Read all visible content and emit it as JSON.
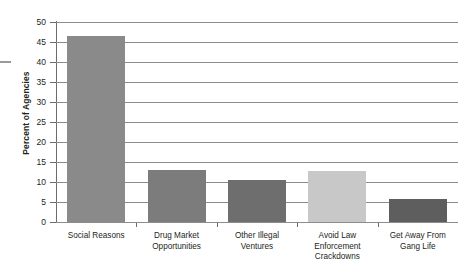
{
  "chart_data": {
    "type": "bar",
    "title": "",
    "xlabel": "",
    "ylabel": "Percent of Agencies",
    "ylim": [
      0,
      50
    ],
    "ytick_step": 5,
    "grid": true,
    "legend": false,
    "categories": [
      "Social Reasons",
      "Drug Market Opportunities",
      "Other Illegal Ventures",
      "Avoid Law Enforcement Crackdowns",
      "Get Away From Gang Life"
    ],
    "category_lines": [
      [
        "Social Reasons"
      ],
      [
        "Drug Market",
        "Opportunities"
      ],
      [
        "Other Illegal",
        "Ventures"
      ],
      [
        "Avoid Law",
        "Enforcement",
        "Crackdowns"
      ],
      [
        "Get Away From",
        "Gang Life"
      ]
    ],
    "values": [
      46.5,
      13.0,
      10.5,
      12.8,
      5.7
    ],
    "bar_colors": [
      "#8a8a8a",
      "#7c7c7c",
      "#6e6e6e",
      "#c8c8c8",
      "#5e5e5e"
    ],
    "ytick_labels": [
      "0",
      "5",
      "10",
      "15",
      "20",
      "25",
      "30",
      "35",
      "40",
      "45",
      "50"
    ],
    "ytick_values": [
      0,
      5,
      10,
      15,
      20,
      25,
      30,
      35,
      40,
      45,
      50
    ]
  }
}
